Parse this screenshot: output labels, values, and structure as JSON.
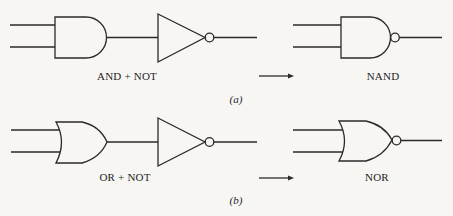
{
  "colors": {
    "stroke": "#2a2a2a",
    "background": "#f7f6f3",
    "text": "#1e1e1e"
  },
  "panels": [
    {
      "id": "a",
      "part_label": "(a)",
      "combo_label": "AND + NOT",
      "result_label": "NAND",
      "combo_gates": [
        "and-gate",
        "not-gate"
      ],
      "result_gate": "nand-gate",
      "arrow": "right-arrow"
    },
    {
      "id": "b",
      "part_label": "(b)",
      "combo_label": "OR + NOT",
      "result_label": "NOR",
      "combo_gates": [
        "or-gate",
        "not-gate"
      ],
      "result_gate": "nor-gate",
      "arrow": "right-arrow"
    }
  ]
}
